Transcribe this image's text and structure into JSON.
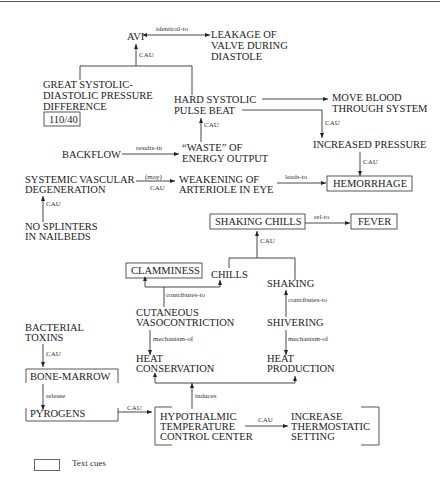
{
  "nodes": {
    "avi": "AVI",
    "leakage": [
      "LEAKAGE OF",
      "VALVE DURING",
      "DIASTOLE"
    ],
    "great_pressure": [
      "GREAT SYSTOLIC-",
      "DIASTOLIC PRESSURE",
      "DIFFERENCE"
    ],
    "bp_value": "110/40",
    "hard_pulse": [
      "HARD SYSTOLIC",
      "PULSE BEAT"
    ],
    "move_blood": [
      "MOVE BLOOD",
      "THROUGH SYSTEM"
    ],
    "increased_pressure": "INCREASED PRESSURE",
    "backflow": "BACKFLOW",
    "waste": [
      "“WASTE” OF",
      "ENERGY OUTPUT"
    ],
    "systemic": [
      "SYSTEMIC VASCULAR",
      "DEGENERATION"
    ],
    "weakening": [
      "WEAKENING OF",
      "ARTERIOLE IN EYE"
    ],
    "hemorrhage": "HEMORRHAGE",
    "no_splinters": [
      "NO SPLINTERS",
      "IN NAILBEDS"
    ],
    "shaking_chills": "SHAKING CHILLS",
    "fever": "FEVER",
    "clamminess": "CLAMMINESS",
    "chills": "CHILLS",
    "shaking": "SHAKING",
    "cutaneous": [
      "CUTANEOUS",
      "VASOCONTRICTION"
    ],
    "shivering": "SHIVERING",
    "heat_conservation": [
      "HEAT",
      "CONSERVATION"
    ],
    "heat_production": [
      "HEAT",
      "PRODUCTION"
    ],
    "bacterial": [
      "BACTERIAL",
      "TOXINS"
    ],
    "bone_marrow": "BONE-MARROW",
    "pyrogens": "PYROGENS",
    "hypothalmic": [
      "HYPOTHALMIC",
      "TEMPERATURE",
      "CONTROL CENTER"
    ],
    "increase_thermo": [
      "INCREASE",
      "THERMOSTATIC",
      "SETTING"
    ]
  },
  "edge_labels": {
    "identical_to": "identical-to",
    "cau": "CAU",
    "results_in": "results-in",
    "may": "(may)",
    "leads_to": "leads-to",
    "rel_to": "rel-to",
    "contributes_to": "contributes-to",
    "mechanism_of": "mechanism-of",
    "release": "release",
    "induces": "induces"
  },
  "legend": {
    "label": "Text cues"
  }
}
